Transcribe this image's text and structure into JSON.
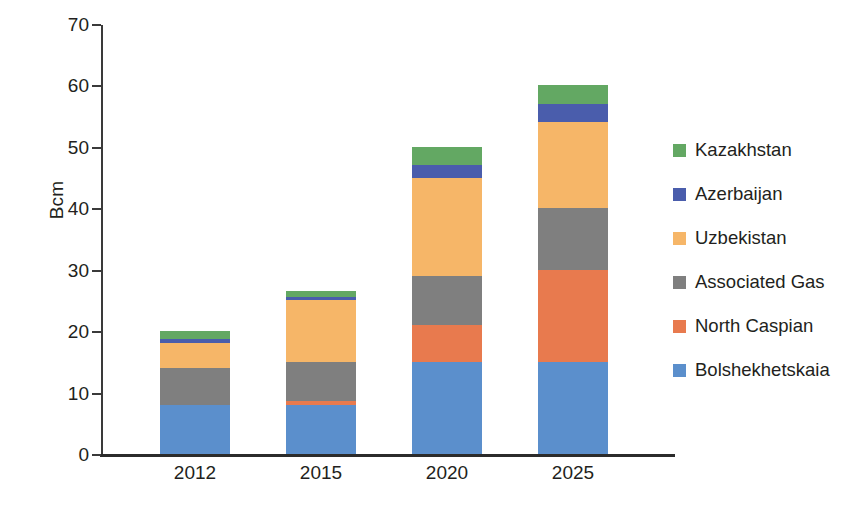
{
  "chart_data": {
    "type": "bar",
    "stacked": true,
    "title": "",
    "subtitle": "",
    "xlabel": "",
    "ylabel": "Bcm",
    "categories": [
      "2012",
      "2015",
      "2020",
      "2025"
    ],
    "ylim": [
      0,
      70
    ],
    "yticks": [
      0,
      10,
      20,
      30,
      40,
      50,
      60,
      70
    ],
    "ytick_labels": [
      "0",
      "10",
      "20",
      "30",
      "40",
      "50",
      "60",
      "70"
    ],
    "grid": false,
    "legend_position": "right",
    "series": [
      {
        "name": "Bolshekhetskaia",
        "color": "#5b8fcc",
        "values": [
          8,
          8,
          15,
          15
        ]
      },
      {
        "name": "North Caspian",
        "color": "#e87a4e",
        "values": [
          0,
          0.6,
          6,
          15
        ]
      },
      {
        "name": "Associated Gas",
        "color": "#7f7f7f",
        "values": [
          6,
          6.4,
          8,
          10
        ]
      },
      {
        "name": "Uzbekistan",
        "color": "#f6b668",
        "values": [
          4,
          10,
          16,
          14
        ]
      },
      {
        "name": "Azerbaijan",
        "color": "#4a5dac",
        "values": [
          0.8,
          0.6,
          2,
          3
        ]
      },
      {
        "name": "Kazakhstan",
        "color": "#63a863",
        "values": [
          1.2,
          0.9,
          3,
          3
        ]
      }
    ],
    "totals": [
      20,
      26.5,
      50,
      60
    ],
    "legend_order": [
      "Kazakhstan",
      "Azerbaijan",
      "Uzbekistan",
      "Associated Gas",
      "North Caspian",
      "Bolshekhetskaia"
    ]
  },
  "axis": {
    "y_title": "Bcm"
  },
  "legend": {
    "items": [
      {
        "label": "Kazakhstan",
        "color": "#63a863"
      },
      {
        "label": "Azerbaijan",
        "color": "#4a5dac"
      },
      {
        "label": "Uzbekistan",
        "color": "#f6b668"
      },
      {
        "label": "Associated Gas",
        "color": "#7f7f7f"
      },
      {
        "label": "North Caspian",
        "color": "#e87a4e"
      },
      {
        "label": "Bolshekhetskaia",
        "color": "#5b8fcc"
      }
    ]
  }
}
